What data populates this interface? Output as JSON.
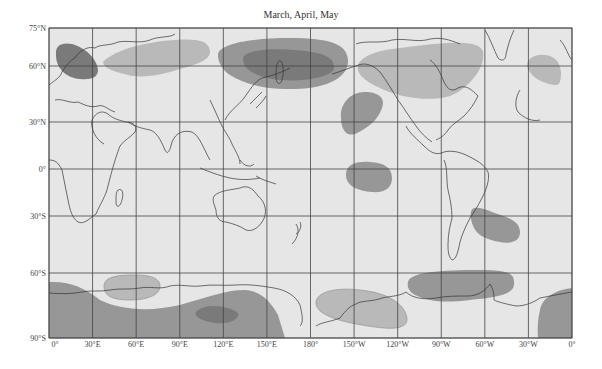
{
  "title": "March, April, May",
  "colors": {
    "background": "#e6e6e6",
    "light_region": "#b9b9b9",
    "medium_region": "#979797",
    "dark_region": "#7a7a7a",
    "coastline": "#333333",
    "grid": "#444444"
  },
  "axes": {
    "lat_labels": [
      "75°N",
      "60°N",
      "30°N",
      "0°",
      "30°S",
      "60°S",
      "90°S"
    ],
    "lon_labels": [
      "0°",
      "30°E",
      "60°E",
      "90°E",
      "120°E",
      "150°E",
      "180°",
      "150°W",
      "120°W",
      "90°W",
      "60°W",
      "30°W",
      "0°"
    ]
  },
  "legend_note": "Shaded regions: lighter and darker anomaly zones",
  "regions": [
    {
      "name": "scandinavia-dark",
      "shade": "dark"
    },
    {
      "name": "siberia-light",
      "shade": "light"
    },
    {
      "name": "east-asia-medium",
      "shade": "medium"
    },
    {
      "name": "east-asia-core-dark",
      "shade": "dark"
    },
    {
      "name": "north-america-light",
      "shade": "light"
    },
    {
      "name": "north-pacific-medium",
      "shade": "medium"
    },
    {
      "name": "equatorial-pacific-medium",
      "shade": "medium"
    },
    {
      "name": "north-atlantic-light",
      "shade": "light"
    },
    {
      "name": "south-atlantic-medium",
      "shade": "medium"
    },
    {
      "name": "southern-ocean-indian-light",
      "shade": "light"
    },
    {
      "name": "antarctica-dark",
      "shade": "medium"
    },
    {
      "name": "antarctica-core-dark",
      "shade": "dark"
    },
    {
      "name": "south-pacific-light",
      "shade": "light"
    },
    {
      "name": "south-america-antarctic-medium",
      "shade": "medium"
    },
    {
      "name": "weddell-medium",
      "shade": "medium"
    }
  ]
}
